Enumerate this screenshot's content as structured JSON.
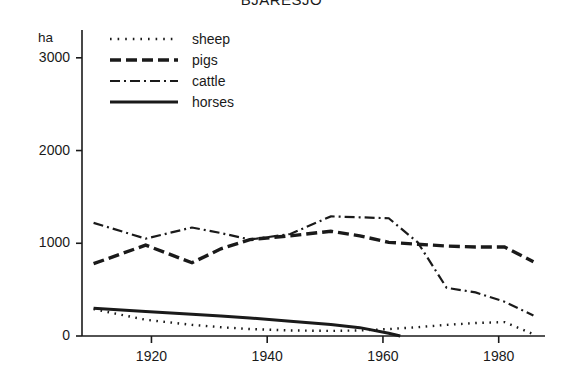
{
  "chart_data": {
    "type": "line",
    "title": "BJÄRESJÖ",
    "xlabel": "",
    "ylabel": "ha",
    "ylim": [
      0,
      3300
    ],
    "xlim": [
      1908,
      1988
    ],
    "yticks": [
      0,
      1000,
      2000,
      3000
    ],
    "ytick_labels": [
      "0",
      "1000",
      "2000",
      "3000"
    ],
    "xticks": [
      1920,
      1940,
      1960,
      1980
    ],
    "xtick_labels": [
      "1920",
      "1940",
      "1960",
      "1980"
    ],
    "grid": false,
    "legend_position": "top-left",
    "series": [
      {
        "name": "sheep",
        "style": "dotted",
        "x": [
          1910,
          1919,
          1927,
          1932,
          1937,
          1944,
          1951,
          1956,
          1961,
          1966,
          1971,
          1976,
          1981,
          1986
        ],
        "values": [
          290,
          175,
          120,
          95,
          75,
          60,
          55,
          60,
          75,
          95,
          120,
          140,
          150,
          20
        ]
      },
      {
        "name": "pigs",
        "style": "dashed",
        "x": [
          1910,
          1919,
          1927,
          1932,
          1937,
          1944,
          1951,
          1956,
          1961,
          1966,
          1971,
          1976,
          1981,
          1986
        ],
        "values": [
          780,
          980,
          790,
          940,
          1040,
          1080,
          1130,
          1080,
          1010,
          990,
          970,
          960,
          960,
          800
        ]
      },
      {
        "name": "cattle",
        "style": "dash-dot",
        "x": [
          1910,
          1919,
          1927,
          1932,
          1937,
          1944,
          1951,
          1956,
          1961,
          1966,
          1971,
          1976,
          1981,
          1986
        ],
        "values": [
          1220,
          1050,
          1170,
          1110,
          1040,
          1100,
          1290,
          1280,
          1270,
          1010,
          520,
          470,
          370,
          220
        ]
      },
      {
        "name": "horses",
        "style": "solid",
        "x": [
          1910,
          1919,
          1927,
          1932,
          1937,
          1944,
          1951,
          1956,
          1961,
          1963
        ],
        "values": [
          300,
          265,
          235,
          215,
          195,
          160,
          125,
          90,
          30,
          0
        ]
      }
    ]
  },
  "legend": {
    "items": [
      {
        "label": "sheep",
        "style": "dotted"
      },
      {
        "label": "pigs",
        "style": "dashed"
      },
      {
        "label": "cattle",
        "style": "dash-dot"
      },
      {
        "label": "horses",
        "style": "solid"
      }
    ]
  }
}
